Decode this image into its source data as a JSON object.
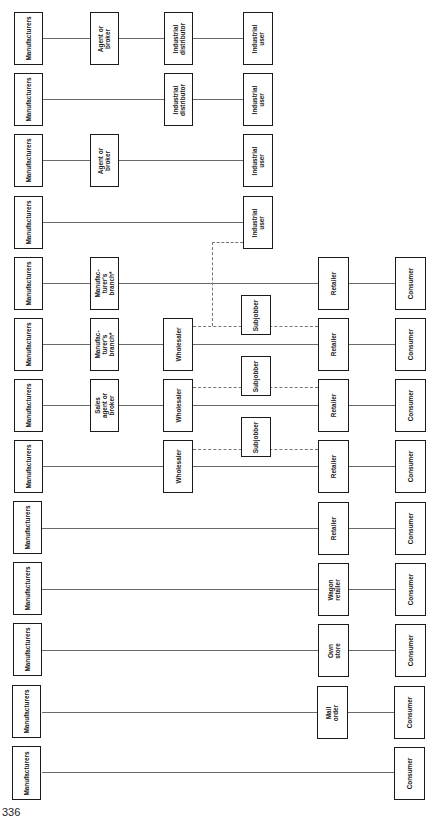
{
  "page_number": "336",
  "footnote_marker": "*",
  "line_color": "#6a6a6a",
  "box_border_color": "#1a1a1a",
  "columns": {
    "manufacturers_x": [
      13,
      42
    ],
    "intermediary1_x": [
      90,
      119
    ],
    "intermediary2_x": [
      164,
      193
    ],
    "subjobber_x": [
      241,
      271
    ],
    "industrial_user_x": [
      243,
      273
    ],
    "retailer_x": [
      318,
      349
    ],
    "consumer_x": [
      395,
      426
    ]
  },
  "channels": [
    {
      "y": 38,
      "nodes": [
        {
          "label": "Manufacturers"
        },
        {
          "label": "Agent or\nbroker"
        },
        {
          "label": "Industrial\ndistributor"
        },
        {
          "label": "Industrial\nuser"
        }
      ]
    },
    {
      "y": 99,
      "nodes": [
        {
          "label": "Manufacturers"
        },
        {
          "label": "Industrial\ndistributor"
        },
        {
          "label": "Industrial\nuser"
        }
      ]
    },
    {
      "y": 160,
      "nodes": [
        {
          "label": "Manufacturers"
        },
        {
          "label": "Agent or\nbroker"
        },
        {
          "label": "Industrial\nuser"
        }
      ]
    },
    {
      "y": 222,
      "nodes": [
        {
          "label": "Manufacturers"
        },
        {
          "label": "Industrial\nuser"
        }
      ]
    },
    {
      "y": 283,
      "nodes": [
        {
          "label": "Manufacturers"
        },
        {
          "label": "Manufac-\nturer's\nbranch*"
        },
        {
          "label": "Retailer"
        },
        {
          "label": "Consumer"
        }
      ]
    },
    {
      "y": 344,
      "nodes": [
        {
          "label": "Manufacturers"
        },
        {
          "label": "Manufac-\nturer's\nbranch*"
        },
        {
          "label": "Wholesaler"
        },
        {
          "label": "Retailer"
        },
        {
          "label": "Consumer"
        }
      ]
    },
    {
      "y": 405,
      "nodes": [
        {
          "label": "Manufacturers"
        },
        {
          "label": "Sales\nagent or\nbroker"
        },
        {
          "label": "Wholesaler"
        },
        {
          "label": "Retailer"
        },
        {
          "label": "Consumer"
        }
      ]
    },
    {
      "y": 466,
      "nodes": [
        {
          "label": "Manufacturers"
        },
        {
          "label": "Wholesaler"
        },
        {
          "label": "Retailer"
        },
        {
          "label": "Consumer"
        }
      ]
    },
    {
      "y": 528,
      "nodes": [
        {
          "label": "Manufacturers"
        },
        {
          "label": "Retailer"
        },
        {
          "label": "Consumer"
        }
      ]
    },
    {
      "y": 589,
      "nodes": [
        {
          "label": "Manufacturers"
        },
        {
          "label": "Wagon\nretailer"
        },
        {
          "label": "Consumer"
        }
      ]
    },
    {
      "y": 650,
      "nodes": [
        {
          "label": "Manufacturers"
        },
        {
          "label": "Own\nstore"
        },
        {
          "label": "Consumer"
        }
      ]
    },
    {
      "y": 712,
      "nodes": [
        {
          "label": "Manufacturers"
        },
        {
          "label": "Mail\norder"
        },
        {
          "label": "Consumer"
        }
      ]
    },
    {
      "y": 772,
      "nodes": [
        {
          "label": "Manufacturers"
        },
        {
          "label": "Consumer"
        }
      ]
    }
  ],
  "subjobbers": [
    {
      "label": "Subjobber",
      "y": 314
    },
    {
      "label": "Subjobber",
      "y": 375
    },
    {
      "label": "Subjobber",
      "y": 437
    }
  ],
  "labels": {
    "manufacturers": "Manufacturers",
    "agent_or_broker": "Agent or\nbroker",
    "industrial_distributor": "Industrial\ndistributor",
    "industrial_user": "Industrial\nuser",
    "manufacturers_branch": "Manufac-\nturer's\nbranch*",
    "sales_agent_or_broker": "Sales\nagent or\nbroker",
    "wholesaler": "Wholesaler",
    "subjobber": "Subjobber",
    "retailer": "Retailer",
    "consumer": "Consumer",
    "wagon_retailer": "Wagon\nretailer",
    "own_store": "Own\nstore",
    "mail_order": "Mail\norder"
  }
}
